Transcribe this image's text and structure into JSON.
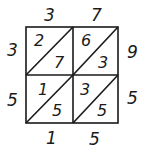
{
  "diagram": {
    "type": "lattice-multiplication",
    "top_factor_digits": [
      "3",
      "7"
    ],
    "left_factor_digits": [
      "3",
      "5"
    ],
    "cells": [
      [
        {
          "tens": "2",
          "ones": "7"
        },
        {
          "tens": "6",
          "ones": "3"
        }
      ],
      [
        {
          "tens": "1",
          "ones": "5"
        },
        {
          "tens": "3",
          "ones": "5"
        }
      ]
    ],
    "right_result_digits": [
      "9",
      "5"
    ],
    "bottom_result_digits": [
      "1",
      "5"
    ]
  }
}
